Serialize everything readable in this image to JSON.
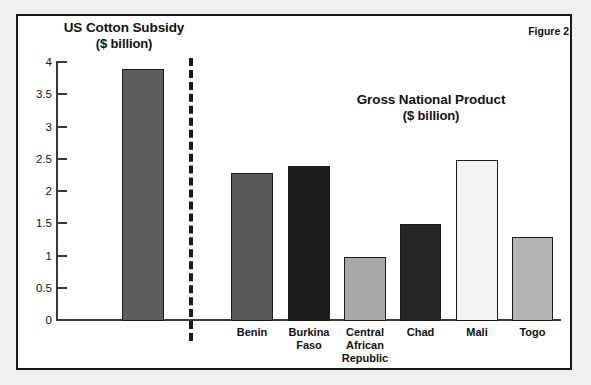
{
  "figure": {
    "label": "Figure 2",
    "left_panel_title": "US Cotton Subsidy",
    "left_panel_subtitle": "($ billion)",
    "right_panel_title": "Gross National Product",
    "right_panel_subtitle": "($ billion)"
  },
  "axis": {
    "ticks": [
      "4",
      "3.5",
      "3",
      "2.5",
      "2",
      "1.5",
      "1",
      "0.5",
      "0"
    ],
    "min": 0,
    "max": 4,
    "step": 0.5
  },
  "colors": {
    "frame": "#1a1a1a",
    "axis": "#3a3a3a",
    "page": "#ffffff",
    "backdrop": "#f1f0ee",
    "bar_us": "#5d5d5d",
    "bar_benin": "#595959",
    "bar_burkina": "#1c1c1c",
    "bar_car": "#a8a8a8",
    "bar_chad": "#262626",
    "bar_mali": "#f2f2f2",
    "bar_togo": "#b5b5b5"
  },
  "chart_data": {
    "type": "bar",
    "title": "Figure 2",
    "xlabel": "",
    "ylabel": "($ billion)",
    "ylim": [
      0,
      4
    ],
    "yticks": [
      0,
      0.5,
      1,
      1.5,
      2,
      2.5,
      3,
      3.5,
      4
    ],
    "grid": false,
    "legend": "none",
    "panels": [
      {
        "name": "US Cotton Subsidy",
        "subtitle": "($ billion)",
        "categories": [
          "US Cotton Subsidy"
        ],
        "values": [
          3.9
        ],
        "colors": [
          "#5d5d5d"
        ]
      },
      {
        "name": "Gross National Product",
        "subtitle": "($ billion)",
        "categories": [
          "Benin",
          "Burkina Faso",
          "Central African Republic",
          "Chad",
          "Mali",
          "Togo"
        ],
        "values": [
          2.3,
          2.4,
          1.0,
          1.5,
          2.5,
          1.3
        ],
        "colors": [
          "#595959",
          "#1c1c1c",
          "#a8a8a8",
          "#262626",
          "#f2f2f2",
          "#b5b5b5"
        ]
      }
    ],
    "annotations": [
      "dashed vertical divider separating the two panels"
    ]
  },
  "bars": [
    {
      "key": "us",
      "label": "",
      "label_lines": [],
      "value": 3.9,
      "left": 122,
      "width": 42,
      "color": "#5d5d5d"
    },
    {
      "key": "benin",
      "label": "Benin",
      "label_lines": [
        "Benin"
      ],
      "value": 2.3,
      "left": 231,
      "width": 42,
      "color": "#595959"
    },
    {
      "key": "burkina",
      "label": "Burkina Faso",
      "label_lines": [
        "Burkina",
        "Faso"
      ],
      "value": 2.4,
      "left": 288,
      "width": 42,
      "color": "#1c1c1c"
    },
    {
      "key": "car",
      "label": "Central African Republic",
      "label_lines": [
        "Central",
        "African",
        "Republic"
      ],
      "value": 1.0,
      "left": 344,
      "width": 42,
      "color": "#a8a8a8"
    },
    {
      "key": "chad",
      "label": "Chad",
      "label_lines": [
        "Chad"
      ],
      "value": 1.5,
      "left": 400,
      "width": 41,
      "color": "#262626"
    },
    {
      "key": "mali",
      "label": "Mali",
      "label_lines": [
        "Mali"
      ],
      "value": 2.5,
      "left": 456,
      "width": 42,
      "color": "#f2f2f2"
    },
    {
      "key": "togo",
      "label": "Togo",
      "label_lines": [
        "Togo"
      ],
      "value": 1.3,
      "left": 512,
      "width": 41,
      "color": "#b5b5b5"
    }
  ]
}
